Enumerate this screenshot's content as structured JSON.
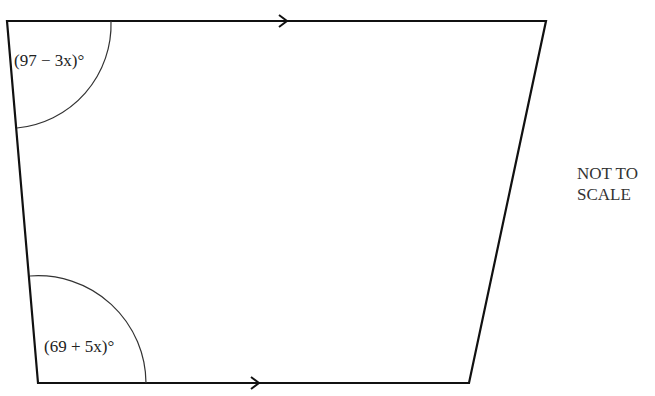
{
  "diagram": {
    "type": "trapezium",
    "shape_note": "Quadrilateral with top and bottom sides parallel (marked with arrows)",
    "vertices": {
      "top_left": [
        7,
        21
      ],
      "top_right": [
        546,
        21
      ],
      "bottom_right": [
        469,
        383
      ],
      "bottom_left": [
        38,
        383
      ]
    },
    "parallel_marks": {
      "top_arrow_x": 285,
      "bottom_arrow_x": 257
    },
    "angles": {
      "top_left": {
        "label": "(97 − 3x)°",
        "arc_radius": 104
      },
      "bottom_left": {
        "label": "(69 + 5x)°",
        "arc_radius": 108
      }
    },
    "note_line1": "NOT TO",
    "note_line2": "SCALE",
    "colors": {
      "stroke": "#111111",
      "text": "#222222"
    }
  }
}
